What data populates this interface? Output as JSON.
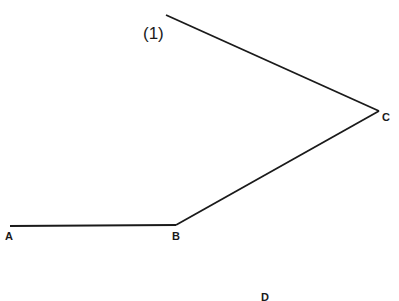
{
  "diagram": {
    "label_1": "(1)",
    "points": {
      "A": "A",
      "B": "B",
      "C": "C",
      "D": "D"
    },
    "segments": [
      {
        "from": "top",
        "to": "C",
        "x1": 166,
        "y1": 15,
        "x2": 379,
        "y2": 111
      },
      {
        "from": "C",
        "to": "B",
        "x1": 379,
        "y1": 111,
        "x2": 176,
        "y2": 225
      },
      {
        "from": "B",
        "to": "A",
        "x1": 176,
        "y1": 225,
        "x2": 10,
        "y2": 226
      }
    ],
    "line_color": "#1a1a1a"
  }
}
